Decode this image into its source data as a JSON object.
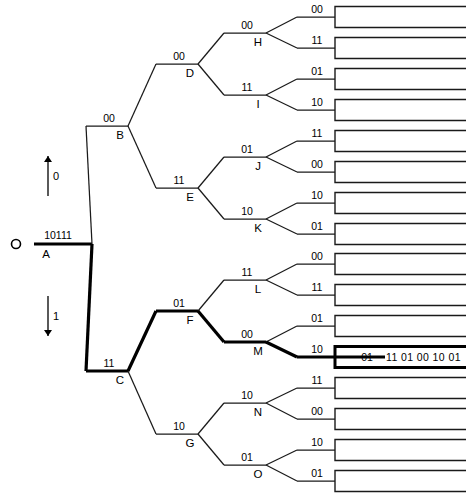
{
  "diagram": {
    "root": {
      "id": "A",
      "code": "10111",
      "x": 28,
      "y": 244
    },
    "branch_arrows": [
      {
        "name": "arrow-up-0",
        "label": "0",
        "x": 48,
        "y_from": 196,
        "y_to": 156,
        "dir": "up"
      },
      {
        "name": "arrow-down-1",
        "label": "1",
        "x": 48,
        "y_from": 296,
        "y_to": 336,
        "dir": "down"
      }
    ],
    "output_text": "11 01 00 10 01",
    "highlight_box_value": "01",
    "nodes": [
      {
        "id": "B",
        "code": "00",
        "x": 128,
        "y": 126,
        "bold": false
      },
      {
        "id": "C",
        "code": "11",
        "x": 128,
        "y": 371,
        "bold": true
      },
      {
        "id": "D",
        "code": "00",
        "x": 198,
        "y": 64,
        "bold": false
      },
      {
        "id": "E",
        "code": "11",
        "x": 198,
        "y": 188,
        "bold": false
      },
      {
        "id": "F",
        "code": "01",
        "x": 198,
        "y": 311,
        "bold": true
      },
      {
        "id": "G",
        "code": "10",
        "x": 198,
        "y": 434,
        "bold": false
      },
      {
        "id": "H",
        "code": "00",
        "x": 266,
        "y": 33,
        "bold": false
      },
      {
        "id": "I",
        "code": "11",
        "x": 266,
        "y": 95,
        "bold": false
      },
      {
        "id": "J",
        "code": "01",
        "x": 266,
        "y": 157,
        "bold": false
      },
      {
        "id": "K",
        "code": "10",
        "x": 266,
        "y": 219,
        "bold": false
      },
      {
        "id": "L",
        "code": "11",
        "x": 266,
        "y": 280,
        "bold": false
      },
      {
        "id": "M",
        "code": "00",
        "x": 266,
        "y": 342,
        "bold": true
      },
      {
        "id": "N",
        "code": "10",
        "x": 266,
        "y": 403,
        "bold": false
      },
      {
        "id": "O",
        "code": "01",
        "x": 266,
        "y": 465,
        "bold": false
      }
    ],
    "leaves": [
      {
        "index": 0,
        "code": "00",
        "y": 17,
        "parent": "H",
        "bold": false
      },
      {
        "index": 1,
        "code": "11",
        "y": 48,
        "parent": "H",
        "bold": false
      },
      {
        "index": 2,
        "code": "01",
        "y": 79,
        "parent": "I",
        "bold": false
      },
      {
        "index": 3,
        "code": "10",
        "y": 110,
        "parent": "I",
        "bold": false
      },
      {
        "index": 4,
        "code": "11",
        "y": 141,
        "parent": "J",
        "bold": false
      },
      {
        "index": 5,
        "code": "00",
        "y": 172,
        "parent": "J",
        "bold": false
      },
      {
        "index": 6,
        "code": "10",
        "y": 203,
        "parent": "K",
        "bold": false
      },
      {
        "index": 7,
        "code": "01",
        "y": 234,
        "parent": "K",
        "bold": false
      },
      {
        "index": 8,
        "code": "00",
        "y": 264,
        "parent": "L",
        "bold": false
      },
      {
        "index": 9,
        "code": "11",
        "y": 295,
        "parent": "L",
        "bold": false
      },
      {
        "index": 10,
        "code": "01",
        "y": 326,
        "parent": "M",
        "bold": false
      },
      {
        "index": 11,
        "code": "10",
        "y": 357,
        "parent": "M",
        "bold": true,
        "value": "01"
      },
      {
        "index": 12,
        "code": "11",
        "y": 388,
        "parent": "N",
        "bold": false
      },
      {
        "index": 13,
        "code": "00",
        "y": 419,
        "parent": "N",
        "bold": false
      },
      {
        "index": 14,
        "code": "10",
        "y": 450,
        "parent": "O",
        "bold": false
      },
      {
        "index": 15,
        "code": "01",
        "y": 481,
        "parent": "O",
        "bold": false
      }
    ],
    "colors": {
      "line": "#1a1a1a",
      "bold_line": "#000000",
      "text": "#000000",
      "background": "#ffffff"
    }
  }
}
